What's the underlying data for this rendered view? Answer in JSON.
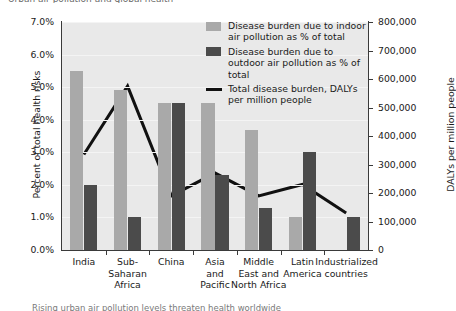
{
  "fragments": {
    "top_clipped": "Urban air pollution and global health",
    "bottom_clipped": "Rising urban air pollution levels threaten health worldwide"
  },
  "legend": {
    "position": "top-right",
    "entries": [
      {
        "name": "indoor-series",
        "swatch": "light",
        "color": "#a9a9a9",
        "label": "Disease burden due to indoor air pollution as % of total"
      },
      {
        "name": "outdoor-series",
        "swatch": "dark",
        "color": "#4b4b4b",
        "label": "Disease burden due to outdoor air pollution as % of total"
      },
      {
        "name": "dalys-series",
        "swatch": "line",
        "color": "#111111",
        "label": "Total disease burden, DALYs per million people"
      }
    ]
  },
  "chart_data": {
    "type": "bar",
    "title": "",
    "categories": [
      "India",
      "Sub-Saharan Africa",
      "China",
      "Asia and Pacific",
      "Middle East and North Africa",
      "Latin America",
      "Industrialized countries"
    ],
    "category_lines": [
      [
        "India"
      ],
      [
        "Sub-",
        "Saharan",
        "Africa"
      ],
      [
        "China"
      ],
      [
        "Asia",
        "and",
        "Pacific"
      ],
      [
        "Middle",
        "East and",
        "North Africa"
      ],
      [
        "Latin",
        "America"
      ],
      [
        "Industrialized",
        "countries"
      ]
    ],
    "series": [
      {
        "name": "Disease burden due to indoor air pollution as % of total",
        "type": "bar",
        "axis": "left",
        "color": "#a9a9a9",
        "values": [
          5.5,
          4.9,
          4.5,
          4.5,
          3.7,
          1.0,
          0.0
        ]
      },
      {
        "name": "Disease burden due to outdoor air pollution as % of total",
        "type": "bar",
        "axis": "left",
        "color": "#4b4b4b",
        "values": [
          2.0,
          1.0,
          4.5,
          2.3,
          1.3,
          3.0,
          1.0
        ]
      },
      {
        "name": "Total disease burden, DALYs per million people",
        "type": "line",
        "axis": "right",
        "color": "#111111",
        "values": [
          335000,
          575000,
          190000,
          270000,
          190000,
          230000,
          130000
        ],
        "values_left_axis_equivalent": [
          2.9,
          5.0,
          1.65,
          2.35,
          1.65,
          2.0,
          1.13
        ]
      }
    ],
    "xlabel": "",
    "grid": true,
    "left_axis": {
      "label": "Percent of total health risks",
      "ylim": [
        0,
        7
      ],
      "ticks": [
        "0.0%",
        "1.0%",
        "2.0%",
        "3.0%",
        "4.0%",
        "5.0%",
        "6.0%",
        "7.0%"
      ],
      "tick_values": [
        0,
        1,
        2,
        3,
        4,
        5,
        6,
        7
      ]
    },
    "right_axis": {
      "label": "DALYs per million people",
      "ylim": [
        0,
        800000
      ],
      "ticks": [
        "0",
        "100,000",
        "200,000",
        "300,000",
        "400,000",
        "500,000",
        "600,000",
        "700,000",
        "800,000"
      ],
      "tick_values": [
        0,
        100000,
        200000,
        300000,
        400000,
        500000,
        600000,
        700000,
        800000
      ]
    }
  }
}
